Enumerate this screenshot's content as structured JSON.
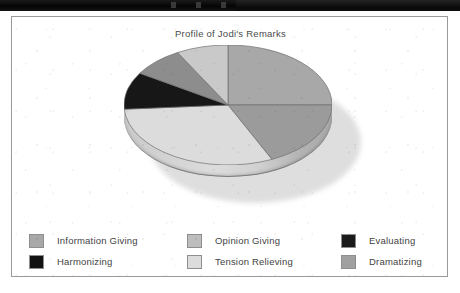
{
  "titlebar": {
    "dots": [
      "titlebar-dot",
      "titlebar-dot",
      "titlebar-dot"
    ]
  },
  "chart": {
    "title": "Profile of Jodi's Remarks"
  },
  "legend": {
    "rows": [
      [
        {
          "label": "Information Giving",
          "color": "#a8a8a8",
          "swatch_name": "legend-swatch-information-giving"
        },
        {
          "label": "Opinion Giving",
          "color": "#bdbdbd",
          "swatch_name": "legend-swatch-opinion-giving"
        },
        {
          "label": "Evaluating",
          "color": "#1a1a1a",
          "swatch_name": "legend-swatch-evaluating"
        }
      ],
      [
        {
          "label": "Harmonizing",
          "color": "#121212",
          "swatch_name": "legend-swatch-harmonizing"
        },
        {
          "label": "Tension Relieving",
          "color": "#dcdcdc",
          "swatch_name": "legend-swatch-tension-relieving"
        },
        {
          "label": "Dramatizing",
          "color": "#a0a0a0",
          "swatch_name": "legend-swatch-dramatizing"
        }
      ]
    ]
  },
  "chart_data": {
    "type": "pie",
    "title": "Profile of Jodi's Remarks",
    "xlabel": "",
    "ylabel": "",
    "grid": false,
    "legend_position": "bottom",
    "three_d": true,
    "start_angle": 0,
    "direction": "clockwise",
    "categories": [
      "Information Giving",
      "Dramatizing",
      "Tension Relieving",
      "Evaluating",
      "Harmonizing",
      "Opinion Giving"
    ],
    "values": [
      25,
      18,
      31,
      10,
      8,
      8
    ],
    "slices": [
      {
        "label": "Information Giving",
        "value": 25,
        "start_deg": 0,
        "end_deg": 90,
        "color": "#a8a8a8"
      },
      {
        "label": "Dramatizing",
        "value": 18,
        "start_deg": 90,
        "end_deg": 155,
        "color": "#9b9b9b"
      },
      {
        "label": "Tension Relieving",
        "value": 31,
        "start_deg": 155,
        "end_deg": 266,
        "color": "#dcdcdc"
      },
      {
        "label": "Evaluating",
        "value": 10,
        "start_deg": 266,
        "end_deg": 302,
        "color": "#171717"
      },
      {
        "label": "Harmonizing",
        "value": 8,
        "start_deg": 302,
        "end_deg": 331,
        "color": "#8d8d8d"
      },
      {
        "label": "Opinion Giving",
        "value": 8,
        "start_deg": 331,
        "end_deg": 360,
        "color": "#c9c9c9"
      }
    ]
  }
}
